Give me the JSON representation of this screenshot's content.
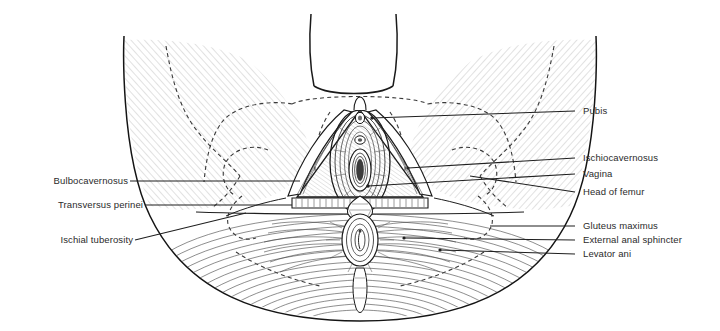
{
  "figure": {
    "view": "inferior (lithotomy) view",
    "style": "black-and-white line engraving with hatched muscle fibres and dashed bone outlines",
    "background_color": "#ffffff",
    "line_color": "#1a1a1a",
    "label_color": "#2b2b2b"
  },
  "labels_left": [
    {
      "text": "Bulbocavernosus",
      "name": "label-bulbocavernosus"
    },
    {
      "text": "Transversus perinei",
      "name": "label-transversus-perinei"
    },
    {
      "text": "Ischial tuberosity",
      "name": "label-ischial-tuberosity"
    }
  ],
  "labels_right": [
    {
      "text": "Pubis",
      "name": "label-pubis"
    },
    {
      "text": "Ischiocavernosus",
      "name": "label-ischiocavernosus"
    },
    {
      "text": "Vagina",
      "name": "label-vagina"
    },
    {
      "text": "Head of femur",
      "name": "label-head-of-femur"
    },
    {
      "text": "Gluteus maximus",
      "name": "label-gluteus-maximus"
    },
    {
      "text": "External anal sphincter",
      "name": "label-external-anal-sphincter"
    },
    {
      "text": "Levator ani",
      "name": "label-levator-ani"
    }
  ],
  "structures": [
    "mons pubis",
    "labia",
    "clitoris",
    "urethral orifice",
    "vaginal orifice",
    "perineal body",
    "anus",
    "ischiopubic rami",
    "obturator region",
    "adductor muscle mass",
    "gluteal fibres"
  ]
}
